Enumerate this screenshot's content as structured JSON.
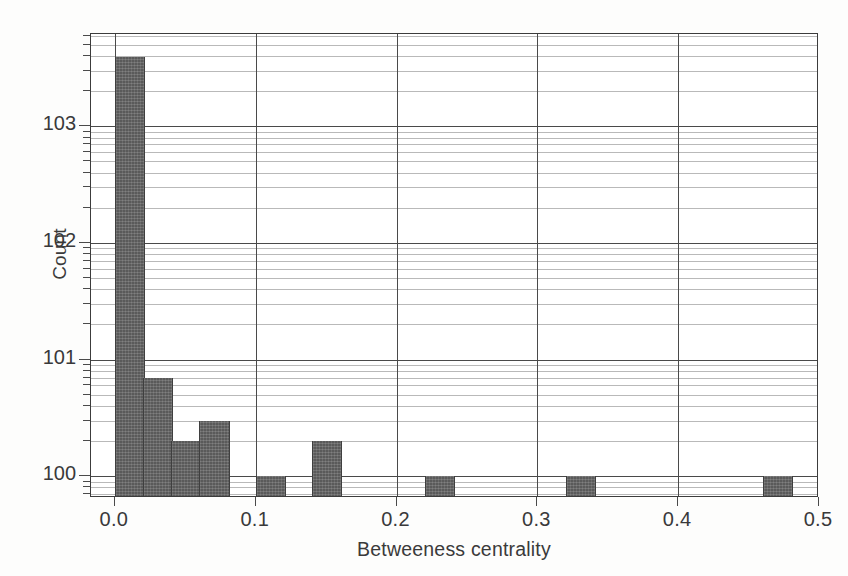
{
  "chart_data": {
    "type": "bar",
    "subtype": "histogram",
    "title": "",
    "xlabel": "Betweeness centrality",
    "ylabel": "Count",
    "xlim": [
      -0.017,
      0.5
    ],
    "ylim": [
      0.65,
      6200
    ],
    "yscale": "log",
    "xscale": "linear",
    "grid": true,
    "grid_minor_y": true,
    "legend": false,
    "bar_color": "#5a5a5a",
    "bin_width": 0.02,
    "xticks": [
      0.0,
      0.1,
      0.2,
      0.3,
      0.4,
      0.5
    ],
    "xtick_labels": [
      "0.0",
      "0.1",
      "0.2",
      "0.3",
      "0.4",
      "0.5"
    ],
    "yticks": [
      1,
      10,
      100,
      1000
    ],
    "ytick_labels": [
      "10⁰",
      "10¹",
      "10²",
      "10³"
    ],
    "ytick_mantissas": [
      "10",
      "10",
      "10",
      "10"
    ],
    "ytick_exponents": [
      "0",
      "1",
      "2",
      "3"
    ],
    "bins": [
      {
        "x0": 0.0,
        "x1": 0.02,
        "count": 3900
      },
      {
        "x0": 0.02,
        "x1": 0.04,
        "count": 7
      },
      {
        "x0": 0.04,
        "x1": 0.06,
        "count": 2
      },
      {
        "x0": 0.06,
        "x1": 0.08,
        "count": 3
      },
      {
        "x0": 0.08,
        "x1": 0.1,
        "count": 0
      },
      {
        "x0": 0.1,
        "x1": 0.12,
        "count": 1
      },
      {
        "x0": 0.12,
        "x1": 0.14,
        "count": 0
      },
      {
        "x0": 0.14,
        "x1": 0.16,
        "count": 2
      },
      {
        "x0": 0.16,
        "x1": 0.18,
        "count": 0
      },
      {
        "x0": 0.18,
        "x1": 0.2,
        "count": 0
      },
      {
        "x0": 0.2,
        "x1": 0.22,
        "count": 0
      },
      {
        "x0": 0.22,
        "x1": 0.24,
        "count": 1
      },
      {
        "x0": 0.24,
        "x1": 0.26,
        "count": 0
      },
      {
        "x0": 0.26,
        "x1": 0.28,
        "count": 0
      },
      {
        "x0": 0.28,
        "x1": 0.3,
        "count": 0
      },
      {
        "x0": 0.3,
        "x1": 0.32,
        "count": 0
      },
      {
        "x0": 0.32,
        "x1": 0.34,
        "count": 1
      },
      {
        "x0": 0.34,
        "x1": 0.36,
        "count": 0
      },
      {
        "x0": 0.36,
        "x1": 0.38,
        "count": 0
      },
      {
        "x0": 0.38,
        "x1": 0.4,
        "count": 0
      },
      {
        "x0": 0.4,
        "x1": 0.42,
        "count": 0
      },
      {
        "x0": 0.42,
        "x1": 0.44,
        "count": 0
      },
      {
        "x0": 0.44,
        "x1": 0.46,
        "count": 0
      },
      {
        "x0": 0.46,
        "x1": 0.48,
        "count": 1
      },
      {
        "x0": 0.48,
        "x1": 0.5,
        "count": 0
      }
    ]
  }
}
